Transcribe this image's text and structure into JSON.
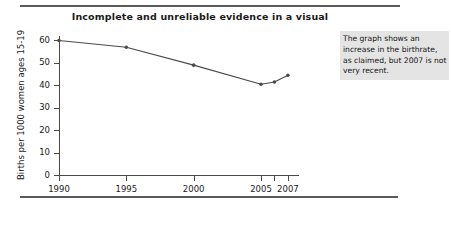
{
  "figure": {
    "title": "Incomplete and unreliable evidence in a visual",
    "callout_note": "The graph shows an increase in the birthrate, as claimed, but 2007 is not very recent.",
    "accent_color": "#4a4a4a",
    "note_background": "#e4e4e4",
    "rule_color": "#5a5a5a"
  },
  "chart_data": {
    "type": "line",
    "title": "Incomplete and unreliable evidence in a visual",
    "xlabel": "",
    "ylabel": "Births per 1000 women ages 15-19",
    "x": [
      1990,
      1995,
      2000,
      2005,
      2006,
      2007
    ],
    "values": [
      60,
      57,
      49,
      40.5,
      41.5,
      44.5
    ],
    "xlim": [
      1990,
      2007.6
    ],
    "ylim": [
      0,
      62
    ],
    "x_tick_values": [
      1990,
      1995,
      2000,
      2005,
      2006,
      2007
    ],
    "x_tick_labels": [
      "1990",
      "1995",
      "2000",
      "2005",
      "",
      "2007"
    ],
    "y_tick_values": [
      0,
      10,
      20,
      30,
      40,
      50,
      60
    ],
    "y_tick_labels": [
      "0",
      "10",
      "20",
      "30",
      "40",
      "50",
      "60"
    ],
    "grid": false,
    "legend": false,
    "marker": "circle",
    "line_color": "#4a4a4a"
  }
}
